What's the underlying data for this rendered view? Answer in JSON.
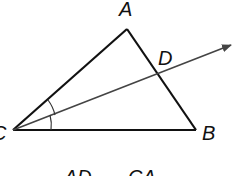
{
  "diagram": {
    "type": "triangle-angle-bisector",
    "points": {
      "A": {
        "label": "A",
        "x": 127,
        "y": 29
      },
      "B": {
        "label": "B",
        "x": 196,
        "y": 130
      },
      "C": {
        "label": "C",
        "x": 13,
        "y": 130
      },
      "D": {
        "label": "D",
        "x": 158,
        "y": 75
      }
    },
    "ray": {
      "from": "C",
      "through": "D",
      "tip_x": 232,
      "tip_y": 44
    },
    "angle_marks": "angle ACD congruent to angle DCB",
    "colors": {
      "stroke": "#111111",
      "ray": "#444444",
      "background": "#ffffff"
    }
  },
  "labels": {
    "A": "A",
    "B": "B",
    "C": "C",
    "D": "D"
  },
  "equation": {
    "left_numerator": "AD",
    "right_numerator": "CA"
  }
}
